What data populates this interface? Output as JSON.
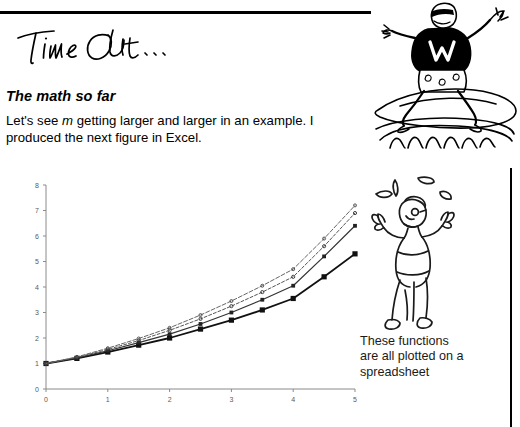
{
  "document": {
    "sidebar_note": "Time Out...",
    "heading": "The math so far",
    "body_lead": "Let's see ",
    "body_var": "m",
    "body_rest": " getting larger and larger in an example. I produced the next figure in Excel.",
    "caption": "These functions are all plotted on a spreadsheet",
    "surfer_icon_label": "surfer-cartoon",
    "juggler_icon_label": "juggler-cartoon",
    "shirt_letter": "W"
  },
  "chart_data": {
    "type": "line",
    "title": "",
    "xlabel": "",
    "ylabel": "",
    "xlim": [
      0,
      5
    ],
    "ylim": [
      0,
      8
    ],
    "xticks": [
      0,
      1,
      2,
      3,
      4,
      5
    ],
    "yticks": [
      0,
      1,
      2,
      3,
      4,
      5,
      6,
      7,
      8
    ],
    "grid": false,
    "legend": "none",
    "x": [
      0,
      0.5,
      1,
      1.5,
      2,
      2.5,
      3,
      3.5,
      4,
      4.5,
      5
    ],
    "series": [
      {
        "name": "m = 1",
        "marker": "square",
        "values": [
          1.0,
          1.2,
          1.45,
          1.72,
          2.0,
          2.35,
          2.7,
          3.1,
          3.55,
          4.4,
          5.3
        ]
      },
      {
        "name": "m = 2",
        "marker": "square",
        "values": [
          1.0,
          1.22,
          1.5,
          1.82,
          2.15,
          2.55,
          3.0,
          3.5,
          4.05,
          5.2,
          6.4
        ]
      },
      {
        "name": "m = 4",
        "marker": "dot",
        "values": [
          1.0,
          1.24,
          1.55,
          1.9,
          2.3,
          2.75,
          3.25,
          3.8,
          4.4,
          5.6,
          6.9
        ]
      },
      {
        "name": "m = infinity",
        "marker": "dot",
        "values": [
          1.0,
          1.26,
          1.6,
          1.98,
          2.4,
          2.9,
          3.45,
          4.05,
          4.7,
          5.9,
          7.2
        ]
      }
    ]
  }
}
